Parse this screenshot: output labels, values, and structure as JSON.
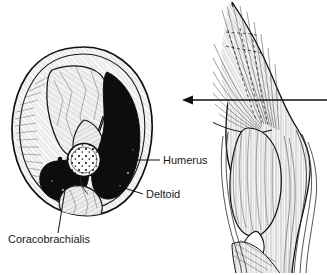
{
  "figure": {
    "background_color": "#ffffff",
    "ink_color": "#111111"
  },
  "labels": [
    {
      "id": "humerus",
      "text": "Humerus",
      "x": 163,
      "y": 164,
      "anchor": "start",
      "leader": {
        "x1": 104,
        "y1": 160,
        "x2": 160,
        "y2": 160
      }
    },
    {
      "id": "deltoid",
      "text": "Deltoid",
      "x": 146,
      "y": 198,
      "anchor": "start",
      "leader": {
        "x1": 118,
        "y1": 186,
        "x2": 143,
        "y2": 194
      }
    },
    {
      "id": "coracobrachialis",
      "text": "Coracobrachialis",
      "x": 8,
      "y": 243,
      "anchor": "start",
      "leader": {
        "x1": 66,
        "y1": 184,
        "x2": 58,
        "y2": 233
      }
    }
  ],
  "arrow": {
    "name": "section-level-arrow",
    "direction": "left",
    "x_start": 327,
    "x_end": 183,
    "y": 100,
    "head_size": 7
  },
  "cross_section": {
    "name": "upper-arm-cross-section",
    "center_x": 82,
    "center_y": 132,
    "regions": [
      {
        "name": "skin-fascia-rim",
        "fill": "#fbfbfb",
        "tone": "outline-hatched"
      },
      {
        "name": "biceps-brachii-compartment",
        "fill": "#f0f0f0",
        "tone": "light-stipple"
      },
      {
        "name": "deltoid-muscle",
        "fill": "#0d0d0d",
        "tone": "solid-black"
      },
      {
        "name": "coracobrachialis-muscle",
        "fill": "#0d0d0d",
        "tone": "solid-black"
      },
      {
        "name": "triceps-compartment",
        "fill": "#ededed",
        "tone": "light-stipple"
      },
      {
        "name": "humerus-bone",
        "fill": "#ffffff",
        "tone": "stippled-marrow"
      }
    ]
  },
  "arm_view": {
    "name": "lateral-arm-illustration",
    "structures": [
      "deltoid-fibers",
      "biceps-brachii-belly",
      "brachialis",
      "cephalic-vein-dashed",
      "antecubital-fossa"
    ],
    "hatching": "fine-line-engraving"
  }
}
